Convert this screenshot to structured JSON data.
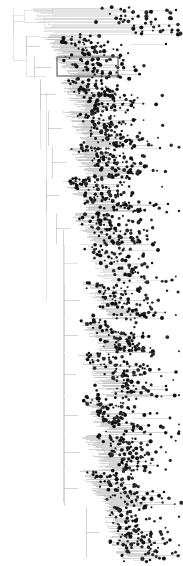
{
  "figure": {
    "kind": "rectangular-cladogram",
    "width": 183,
    "height": 566,
    "background_color": "#ffffff",
    "branch_color": "#b9b9b9",
    "deep_branch_color": "#cfcfcf",
    "node_color": "#111111",
    "highlight_stroke_color": "#555555"
  },
  "highlight_box": {
    "label": "highlighted-clade",
    "x": 57,
    "y": 57,
    "width": 61,
    "height": 19
  },
  "chart_data": {
    "type": "tree",
    "root": {
      "x": 13,
      "y": 38
    },
    "spine": {
      "x": 63.5,
      "y_top": 230,
      "y_bottom": 502
    },
    "node_radius_range": [
      0.9,
      2.1
    ],
    "tip_count": 430,
    "clades": [
      {
        "name": "clade-A-top-longbranch",
        "y_start": 8,
        "y_end": 34,
        "stem_x": 13,
        "depth_x": 24,
        "tip_count": 22,
        "tip_x_min": 104,
        "tip_x_max": 176,
        "shade": "deep"
      },
      {
        "name": "clade-B-upper",
        "y_start": 36,
        "y_end": 56,
        "stem_x": 26,
        "depth_x": 40,
        "tip_count": 26,
        "tip_x_min": 60,
        "tip_x_max": 120,
        "shade": "normal"
      },
      {
        "name": "clade-C-boxed",
        "y_start": 57,
        "y_end": 78,
        "stem_x": 34,
        "depth_x": 52,
        "tip_count": 30,
        "tip_x_min": 62,
        "tip_x_max": 126,
        "shade": "normal"
      },
      {
        "name": "clade-D",
        "y_start": 79,
        "y_end": 110,
        "stem_x": 40,
        "depth_x": 56,
        "tip_count": 44,
        "tip_x_min": 66,
        "tip_x_max": 132,
        "shade": "normal"
      },
      {
        "name": "clade-E",
        "y_start": 111,
        "y_end": 146,
        "stem_x": 48,
        "depth_x": 62,
        "tip_count": 46,
        "tip_x_min": 72,
        "tip_x_max": 150,
        "shade": "normal"
      },
      {
        "name": "clade-F",
        "y_start": 147,
        "y_end": 178,
        "stem_x": 52,
        "depth_x": 66,
        "tip_count": 40,
        "tip_x_min": 78,
        "tip_x_max": 148,
        "shade": "normal"
      },
      {
        "name": "clade-G",
        "y_start": 179,
        "y_end": 212,
        "stem_x": 46,
        "depth_x": 60,
        "tip_count": 42,
        "tip_x_min": 64,
        "tip_x_max": 152,
        "shade": "normal"
      },
      {
        "name": "clade-H",
        "y_start": 213,
        "y_end": 244,
        "stem_x": 56,
        "depth_x": 70,
        "tip_count": 38,
        "tip_x_min": 74,
        "tip_x_max": 146,
        "shade": "normal"
      },
      {
        "name": "clade-I-sparse",
        "y_start": 245,
        "y_end": 282,
        "stem_x": 64,
        "depth_x": 78,
        "tip_count": 30,
        "tip_x_min": 82,
        "tip_x_max": 160,
        "shade": "deep"
      },
      {
        "name": "clade-J",
        "y_start": 283,
        "y_end": 318,
        "stem_x": 64,
        "depth_x": 80,
        "tip_count": 34,
        "tip_x_min": 84,
        "tip_x_max": 154,
        "shade": "normal"
      },
      {
        "name": "clade-K",
        "y_start": 319,
        "y_end": 352,
        "stem_x": 64,
        "depth_x": 78,
        "tip_count": 36,
        "tip_x_min": 80,
        "tip_x_max": 150,
        "shade": "normal"
      },
      {
        "name": "clade-L-wide",
        "y_start": 353,
        "y_end": 396,
        "stem_x": 64,
        "depth_x": 76,
        "tip_count": 44,
        "tip_x_min": 78,
        "tip_x_max": 170,
        "shade": "normal"
      },
      {
        "name": "clade-M",
        "y_start": 397,
        "y_end": 434,
        "stem_x": 64,
        "depth_x": 78,
        "tip_count": 40,
        "tip_x_min": 84,
        "tip_x_max": 156,
        "shade": "normal"
      },
      {
        "name": "clade-N",
        "y_start": 435,
        "y_end": 470,
        "stem_x": 64,
        "depth_x": 80,
        "tip_count": 38,
        "tip_x_min": 92,
        "tip_x_max": 164,
        "shade": "normal"
      },
      {
        "name": "clade-O-terminal",
        "y_start": 471,
        "y_end": 506,
        "stem_x": 64,
        "depth_x": 78,
        "tip_count": 40,
        "tip_x_min": 86,
        "tip_x_max": 160,
        "shade": "normal"
      },
      {
        "name": "clade-P-bottom-cluster",
        "y_start": 507,
        "y_end": 558,
        "stem_x": 86,
        "depth_x": 100,
        "tip_count": 46,
        "tip_x_min": 106,
        "tip_x_max": 158,
        "shade": "normal"
      }
    ],
    "xlabel": "",
    "ylabel": "",
    "legend": [],
    "grid": false
  }
}
